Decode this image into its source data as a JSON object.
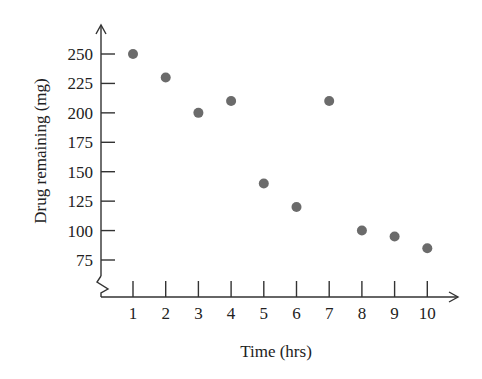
{
  "chart_data": {
    "type": "scatter",
    "title": "",
    "xlabel": "Time (hrs)",
    "ylabel": "Drug remaining (mg)",
    "x": [
      1,
      2,
      3,
      4,
      5,
      6,
      7,
      8,
      9,
      10
    ],
    "y": [
      250,
      230,
      200,
      210,
      140,
      120,
      210,
      100,
      95,
      85
    ],
    "xticks": [
      1,
      2,
      3,
      4,
      5,
      6,
      7,
      8,
      9,
      10
    ],
    "yticks": [
      75,
      100,
      125,
      150,
      175,
      200,
      225,
      250
    ],
    "xlim": [
      0,
      11
    ],
    "ylim": [
      75,
      250
    ],
    "y_axis_break": true,
    "grid": false,
    "legend": null,
    "marker_color": "#6b6b6b",
    "axis_color": "#333333"
  }
}
